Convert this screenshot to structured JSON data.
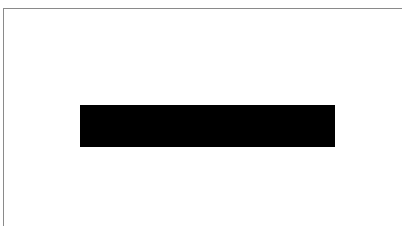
{
  "page": {
    "background_color": "#ffffff",
    "border_color": "#8a8a8a"
  },
  "redaction": {
    "color": "#000000",
    "text": ""
  }
}
